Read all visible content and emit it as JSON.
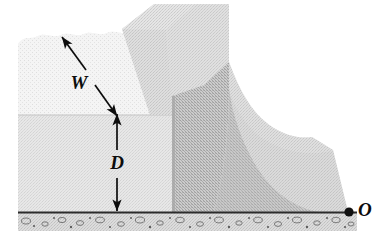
{
  "figure": {
    "name": "dam-cross-section-diagram",
    "type": "physics-diagram",
    "background_color": "#ffffff"
  },
  "labels": {
    "width_label": "W",
    "depth_label": "D",
    "origin_label": "O"
  },
  "annotations": {
    "width_arrow": {
      "name": "width-dimension-arrow",
      "style": "double-headed",
      "orientation": "diagonal",
      "from_x": 62,
      "from_y": 37,
      "to_x": 117,
      "to_y": 116,
      "measures": "W"
    },
    "depth_arrow": {
      "name": "depth-dimension-arrow",
      "style": "double-headed",
      "orientation": "vertical",
      "from_x": 117,
      "from_y": 114,
      "to_x": 117,
      "to_y": 211,
      "measures": "D"
    },
    "origin_point": {
      "name": "origin-dot",
      "x": 349,
      "y": 212,
      "radius": 4.5,
      "color": "#111111"
    }
  },
  "colors": {
    "water_upper": "#e6e6e6",
    "water_lower": "#d9d9d9",
    "dam_face_light": "#d0d0d0",
    "dam_face_mid": "#c3c3c3",
    "dam_face_dark": "#aeaeae",
    "dam_crest_top": "#c9c9c9",
    "spillway": "#c9c9c9",
    "ground_fill": "#bdbdbd",
    "ground_line": "#2e2e2e",
    "pebble": "#7d7d7d",
    "ink": "#0d0d0d"
  },
  "geometry": {
    "water_surface_y": 33,
    "water_left_x": 18,
    "water_shade_break_y": 115,
    "dam_upstream_face_x": 172,
    "ground_top_y": 212,
    "ground_bottom_y": 231,
    "canvas_width": 372,
    "canvas_height": 234
  },
  "parts": [
    {
      "name": "reservoir-water",
      "label": "water body behind dam"
    },
    {
      "name": "dam-body",
      "label": "concrete dam"
    },
    {
      "name": "dam-crest",
      "label": "dam crest / top walkway"
    },
    {
      "name": "spillway-slope",
      "label": "curved downstream spillway face"
    },
    {
      "name": "riverbed-ground",
      "label": "speckled rock riverbed"
    }
  ]
}
